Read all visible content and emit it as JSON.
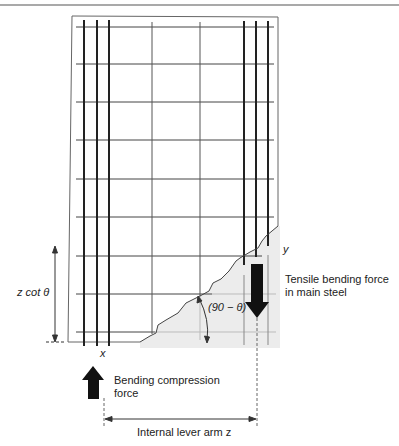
{
  "figure": {
    "type": "reinforced concrete beam shear crack free-body diagram",
    "labels": {
      "z_cot_theta": "z cot θ",
      "angle": "(90 − θ)",
      "point_x": "x",
      "point_y": "y",
      "tensile_force_line1": "Tensile bending force",
      "tensile_force_line2": "in main steel",
      "compression_force_line1": "Bending compression",
      "compression_force_line2": "force",
      "lever_arm": "Internal lever arm z"
    },
    "colors": {
      "line": "#333333",
      "bar": "#222222",
      "shaded_region": "#ececec",
      "arrow_fill": "#111111"
    },
    "grid": {
      "horizontal_rows": 9,
      "left_bars": 3,
      "right_bars": 3,
      "thin_vertical_links": 2
    }
  }
}
